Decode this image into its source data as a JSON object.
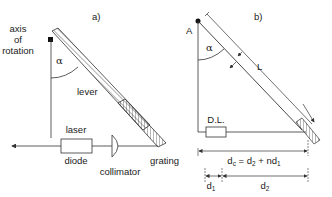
{
  "panel_a": {
    "label": "a)",
    "axis_label_line1": "axis",
    "axis_label_line2": "of",
    "axis_label_line3": "rotation",
    "angle_symbol": "α",
    "lever_label": "lever",
    "laser_label": "laser",
    "diode_label": "diode",
    "collimator_label": "collimator",
    "grating_label": "grating"
  },
  "panel_b": {
    "label": "b)",
    "pivot_label": "A",
    "angle_symbol": "α",
    "length_label": "L",
    "diode_box_label": "D.L.",
    "dc_equation": "d",
    "dc_sub": "c",
    "dc_rhs1": " = d",
    "dc_rhs1_sub": "2",
    "dc_rhs2": " + nd",
    "dc_rhs2_sub": "1",
    "d1_label": "d",
    "d1_sub": "1",
    "d2_label": "d",
    "d2_sub": "2"
  },
  "colors": {
    "line": "#333333",
    "text": "#222222"
  }
}
